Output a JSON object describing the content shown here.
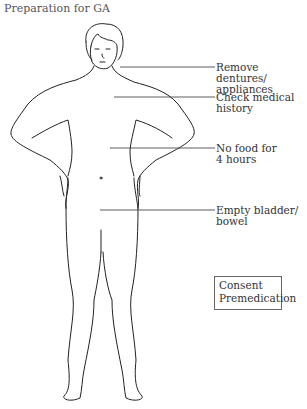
{
  "title": "Preparation for GA",
  "labels": [
    {
      "line1": "Remove dentures/",
      "line2": "appliances"
    },
    {
      "line1": "Check medical",
      "line2": "history"
    },
    {
      "line1": "No food for",
      "line2": "4 hours"
    },
    {
      "line1": "Empty bladder/",
      "line2": "bowel"
    }
  ],
  "box": {
    "line1": "Consent",
    "line2": "Premedication"
  }
}
